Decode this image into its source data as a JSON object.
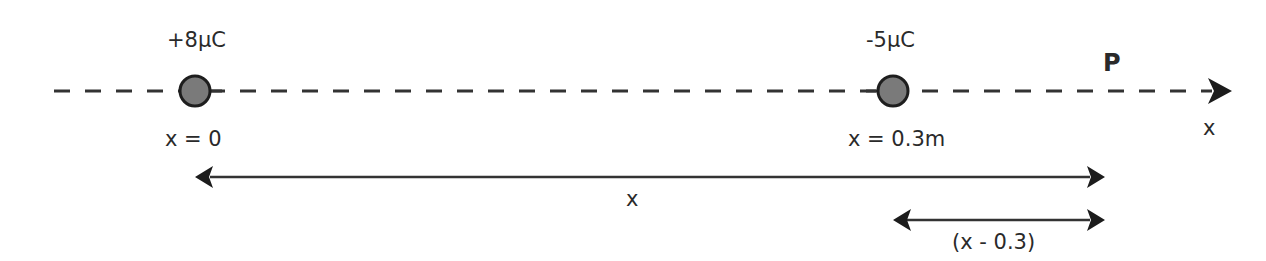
{
  "diagram": {
    "axis": {
      "label": "x",
      "direction": "positive-right"
    },
    "charges": [
      {
        "charge_label": "+8μC",
        "position_label": "x = 0",
        "position_m": 0
      },
      {
        "charge_label": "-5μC",
        "position_label": "x = 0.3m",
        "position_m": 0.3
      }
    ],
    "point": {
      "label": "P"
    },
    "dimensions": [
      {
        "label": "x",
        "from": "x = 0",
        "to": "P"
      },
      {
        "label": "(x - 0.3)",
        "from": "x = 0.3m",
        "to": "P"
      }
    ],
    "colors": {
      "line": "#333333",
      "charge_fill": "#7a7a7a",
      "text": "#2a2a2a"
    }
  }
}
